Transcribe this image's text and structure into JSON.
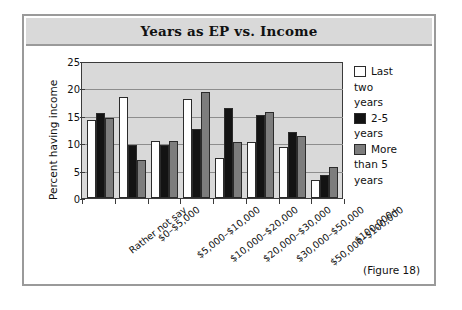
{
  "figure": {
    "title": "Years as EP vs. Income",
    "caption": "(Figure 18)"
  },
  "chart_data": {
    "type": "bar",
    "title": "Years as EP vs. Income",
    "xlabel": "",
    "ylabel": "Percent having income",
    "ylim": [
      0,
      25
    ],
    "yticks": [
      0,
      5,
      10,
      15,
      20,
      25
    ],
    "grid": true,
    "legend_position": "right",
    "categories": [
      "Rather not say",
      "$0–$5,000",
      "$5,000–$10,000",
      "$10,000–$20,000",
      "$20,000–$30,000",
      "$30,000–$50,000",
      "$50,000–$100,000",
      "$100,000+"
    ],
    "series": [
      {
        "name": "Last two years",
        "color": "#ffffff",
        "values": [
          14.4,
          18.7,
          10.6,
          18.4,
          7.4,
          10.3,
          9.4,
          3.3
        ]
      },
      {
        "name": "2-5 years",
        "color": "#131313",
        "values": [
          15.7,
          9.9,
          9.8,
          12.7,
          16.6,
          15.3,
          12.3,
          4.3
        ]
      },
      {
        "name": "More than 5 years",
        "color": "#7d7d7d",
        "values": [
          14.9,
          7.1,
          10.6,
          19.7,
          10.3,
          16.0,
          11.5,
          5.7
        ]
      }
    ],
    "legend": [
      {
        "label_line1": "Last",
        "label_line2": "two",
        "label_line3": "years"
      },
      {
        "label_line1": "2-5",
        "label_line2": "years",
        "label_line3": ""
      },
      {
        "label_line1": "More",
        "label_line2": "than 5",
        "label_line3": "years"
      }
    ]
  }
}
